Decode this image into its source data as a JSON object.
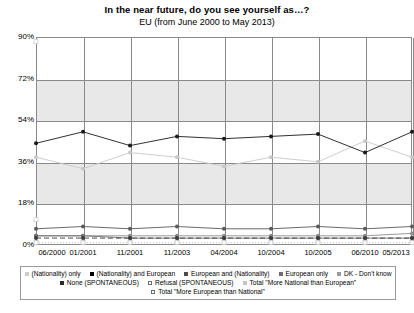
{
  "chart_data": {
    "type": "line",
    "title": "In the near future, do you see yourself as…?",
    "subtitle": "EU (from June 2000 to May 2013)",
    "xlabel": "",
    "ylabel": "",
    "ylim": [
      0,
      90
    ],
    "yticks": [
      "0%",
      "18%",
      "36%",
      "54%",
      "72%",
      "90%"
    ],
    "ytick_values": [
      0,
      18,
      36,
      54,
      72,
      90
    ],
    "grid": true,
    "legend_position": "bottom",
    "categories": [
      "06/2000",
      "01/2001",
      "11/2001",
      "11/2003",
      "04/2004",
      "10/2004",
      "10/2005",
      "06/2010",
      "05/2013"
    ],
    "series": [
      {
        "name": "(Nationality) only",
        "color": "#c8c8c8",
        "marker": "circle",
        "line": "solid",
        "values": [
          38,
          33,
          40,
          38,
          34,
          38,
          36,
          45,
          38
        ]
      },
      {
        "name": "(Nationality) and European",
        "color": "#1a1a1a",
        "marker": "circle",
        "line": "solid",
        "values": [
          44,
          49,
          43,
          47,
          46,
          47,
          48,
          40,
          49
        ]
      },
      {
        "name": "European and (Nationality)",
        "color": "#5a5a5a",
        "marker": "circle",
        "line": "solid",
        "values": [
          7,
          8,
          7,
          8,
          7,
          7,
          8,
          7,
          8
        ]
      },
      {
        "name": "European only",
        "color": "#8c8c8c",
        "marker": "circle",
        "line": "solid",
        "values": [
          4,
          4,
          4,
          4,
          4,
          4,
          4,
          4,
          5
        ]
      },
      {
        "name": "DK - Don't know",
        "color": "#707070",
        "marker": "circle",
        "line": "solid",
        "values": [
          4,
          4,
          3,
          3,
          3,
          3,
          3,
          3,
          3
        ]
      },
      {
        "name": "None (SPONTANEOUS)",
        "color": "#3c3c3c",
        "marker": "circle",
        "line": "dashed",
        "values": [
          3,
          3,
          3,
          3,
          3,
          3,
          3,
          3,
          3
        ]
      },
      {
        "name": "Refusal (SPONTANEOUS)",
        "color": "#bdbdbd",
        "marker": "square-open",
        "line": "dotted",
        "values": [
          1,
          1,
          1,
          1,
          1,
          1,
          1,
          1,
          1
        ]
      },
      {
        "name": "Total \"More National than European\"",
        "color": "#d0d0d0",
        "marker": "square-open",
        "line": "none",
        "values": [
          88,
          null,
          null,
          null,
          null,
          null,
          null,
          null,
          null
        ]
      },
      {
        "name": "Total \"More European than National\"",
        "color": "#d0d0d0",
        "marker": "square-open",
        "line": "none",
        "values": [
          11,
          null,
          null,
          null,
          null,
          null,
          null,
          null,
          null
        ]
      }
    ]
  },
  "legend": {
    "row1": [
      {
        "label": "(Nationality) only",
        "marker_color": "#cdcdcd",
        "marker_style": "filled"
      },
      {
        "label": "(Nationality) and European",
        "marker_color": "#000000",
        "marker_style": "filled"
      },
      {
        "label": "European and (Nationality)",
        "marker_color": "#4d4d4d",
        "marker_style": "filled"
      },
      {
        "label": "European only",
        "marker_color": "#6e6e6e",
        "marker_style": "filled"
      },
      {
        "label": "DK - Don't know",
        "marker_color": "#9a9a9a",
        "marker_style": "filled"
      }
    ],
    "row2": [
      {
        "label": "None (SPONTANEOUS)",
        "marker_color": "#2b2b2b",
        "marker_style": "filled"
      },
      {
        "label": "Refusal (SPONTANEOUS)",
        "marker_color": "#ffffff",
        "marker_style": "open"
      },
      {
        "label": "Total \"More National than European\"",
        "marker_color": "#c4c4c4",
        "marker_style": "filled"
      }
    ],
    "row3": [
      {
        "label": "Total \"More European than National\"",
        "marker_color": "#ffffff",
        "marker_style": "open"
      }
    ]
  }
}
